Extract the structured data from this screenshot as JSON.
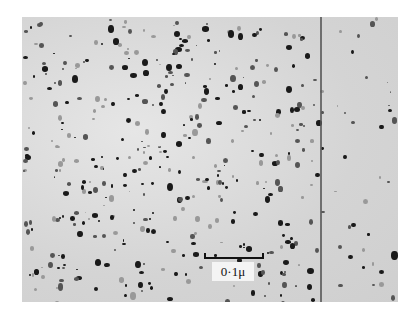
{
  "figure": {
    "type": "electron micrograph",
    "scale_bar": {
      "label": "0·1μ"
    },
    "colors": {
      "background": "#dcdcdc",
      "particles": "#1a1a1a",
      "page": "#ffffff"
    }
  }
}
